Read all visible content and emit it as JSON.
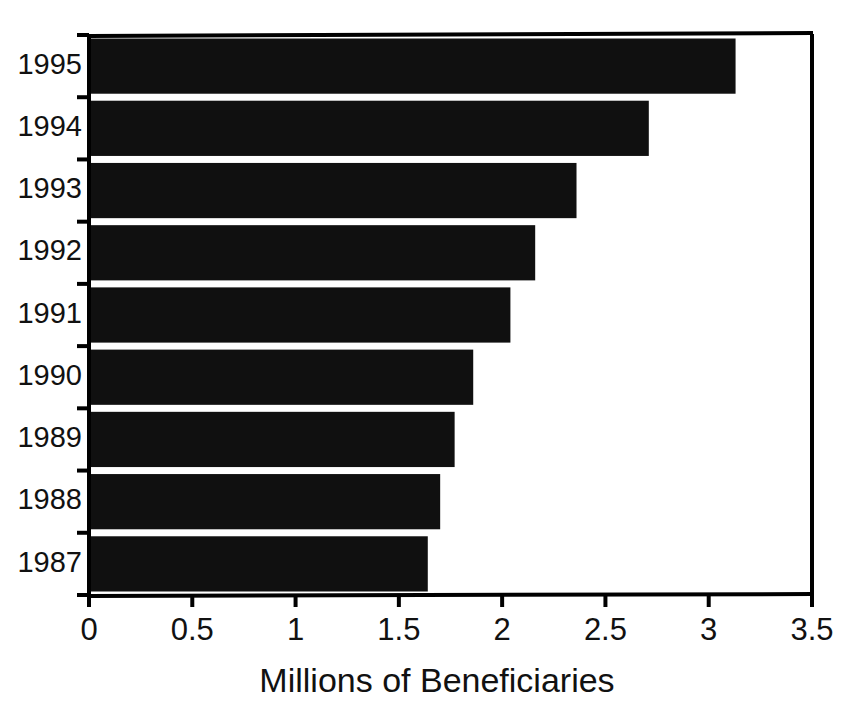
{
  "chart_data": {
    "type": "bar",
    "orientation": "horizontal",
    "title": "",
    "subtitle": "",
    "xlabel": "Millions of Beneficiaries",
    "ylabel": "",
    "categories": [
      "1995",
      "1994",
      "1993",
      "1992",
      "1991",
      "1990",
      "1989",
      "1988",
      "1987"
    ],
    "values": [
      3.13,
      2.71,
      2.36,
      2.16,
      2.04,
      1.86,
      1.77,
      1.7,
      1.64
    ],
    "series": [
      {
        "name": "Millions of Beneficiaries",
        "values": [
          3.13,
          2.71,
          2.36,
          2.16,
          2.04,
          1.86,
          1.77,
          1.7,
          1.64
        ]
      }
    ],
    "xlim": [
      0,
      3.5
    ],
    "xticks": [
      0,
      0.5,
      1,
      1.5,
      2,
      2.5,
      3,
      3.5
    ],
    "xtick_labels": [
      "0",
      "0.5",
      "1",
      "1.5",
      "2",
      "2.5",
      "3",
      "3.5"
    ],
    "ytick_labels": [
      "1995",
      "1994",
      "1993",
      "1992",
      "1991",
      "1990",
      "1989",
      "1988",
      "1987"
    ],
    "grid": false,
    "legend": false,
    "legend_position": "none",
    "bar_color": "#101010",
    "axis_color": "#000000",
    "background_color": "#ffffff",
    "annotations": []
  },
  "axis": {
    "x_title": "Millions of Beneficiaries"
  }
}
